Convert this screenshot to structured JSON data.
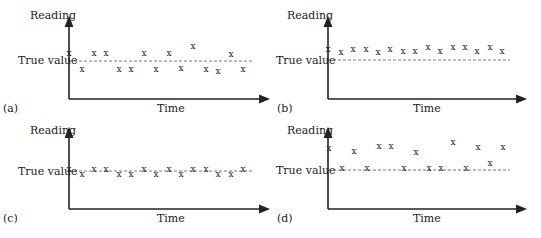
{
  "figure": {
    "panels": [
      {
        "id": "a",
        "tag": "(a)",
        "y_label": "Reading",
        "x_label": "Time",
        "reference_label": "True value",
        "description": "Low bias, high scatter",
        "origin": [
          69,
          99
        ],
        "y_top": 18,
        "x_end": 268,
        "ref_y": 61,
        "tag_pos": [
          3,
          112
        ],
        "ylabel_pos": [
          30,
          19
        ],
        "xlabel_pos": [
          157,
          112
        ],
        "reflabel_pos": [
          18,
          64
        ],
        "points": [
          [
            69,
            53
          ],
          [
            82,
            69
          ],
          [
            94,
            53
          ],
          [
            106,
            53
          ],
          [
            119,
            69
          ],
          [
            131,
            69
          ],
          [
            144,
            53
          ],
          [
            156,
            69
          ],
          [
            169,
            53
          ],
          [
            181,
            68
          ],
          [
            193,
            46
          ],
          [
            206,
            69
          ],
          [
            218,
            71
          ],
          [
            231,
            54
          ],
          [
            243,
            69
          ]
        ]
      },
      {
        "id": "b",
        "tag": "(b)",
        "y_label": "Reading",
        "x_label": "Time",
        "reference_label": "True value",
        "description": "High bias, low scatter",
        "origin": [
          328,
          99
        ],
        "y_top": 18,
        "x_end": 525,
        "ref_y": 60,
        "tag_pos": [
          277,
          112
        ],
        "ylabel_pos": [
          287,
          19
        ],
        "xlabel_pos": [
          413,
          112
        ],
        "reflabel_pos": [
          276,
          64
        ],
        "points": [
          [
            328,
            49
          ],
          [
            341,
            52
          ],
          [
            353,
            49
          ],
          [
            366,
            49
          ],
          [
            378,
            52
          ],
          [
            390,
            49
          ],
          [
            403,
            51
          ],
          [
            415,
            51
          ],
          [
            428,
            47
          ],
          [
            440,
            51
          ],
          [
            453,
            47
          ],
          [
            465,
            47
          ],
          [
            477,
            51
          ],
          [
            490,
            47
          ],
          [
            502,
            51
          ]
        ]
      },
      {
        "id": "c",
        "tag": "(c)",
        "y_label": "Reading",
        "x_label": "Time",
        "reference_label": "True value",
        "description": "Low bias, low scatter",
        "origin": [
          69,
          209
        ],
        "y_top": 129,
        "x_end": 268,
        "ref_y": 171,
        "tag_pos": [
          3,
          222
        ],
        "ylabel_pos": [
          30,
          134
        ],
        "xlabel_pos": [
          157,
          222
        ],
        "reflabel_pos": [
          18,
          175
        ],
        "points": [
          [
            69,
            169
          ],
          [
            82,
            174
          ],
          [
            94,
            169
          ],
          [
            106,
            169
          ],
          [
            119,
            174
          ],
          [
            131,
            174
          ],
          [
            144,
            169
          ],
          [
            156,
            174
          ],
          [
            169,
            169
          ],
          [
            181,
            174
          ],
          [
            193,
            169
          ],
          [
            206,
            169
          ],
          [
            218,
            174
          ],
          [
            231,
            174
          ],
          [
            243,
            169
          ]
        ]
      },
      {
        "id": "d",
        "tag": "(d)",
        "y_label": "Reading",
        "x_label": "Time",
        "reference_label": "True value",
        "description": "High bias, high scatter",
        "origin": [
          328,
          209
        ],
        "y_top": 129,
        "x_end": 525,
        "ref_y": 170,
        "tag_pos": [
          277,
          222
        ],
        "ylabel_pos": [
          287,
          134
        ],
        "xlabel_pos": [
          413,
          222
        ],
        "reflabel_pos": [
          276,
          174
        ],
        "points": [
          [
            329,
            148
          ],
          [
            342,
            168
          ],
          [
            354,
            151
          ],
          [
            367,
            168
          ],
          [
            379,
            146
          ],
          [
            391,
            146
          ],
          [
            404,
            168
          ],
          [
            416,
            152
          ],
          [
            429,
            168
          ],
          [
            441,
            168
          ],
          [
            453,
            142
          ],
          [
            466,
            168
          ],
          [
            478,
            147
          ],
          [
            490,
            163
          ],
          [
            503,
            147
          ]
        ]
      }
    ],
    "marker_glyph": "x"
  }
}
